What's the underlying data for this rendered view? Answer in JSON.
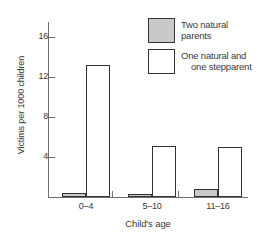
{
  "chart_data": {
    "type": "bar",
    "title": "",
    "xlabel": "Child's age",
    "ylabel": "Victims per 1000 children",
    "categories": [
      "0–4",
      "5–10",
      "11–16"
    ],
    "series": [
      {
        "name": "Two natural parents",
        "values": [
          0.4,
          0.3,
          0.8
        ],
        "color": "#c9c9c9"
      },
      {
        "name": "One natural and one stepparent",
        "values": [
          13.2,
          5.1,
          5.0
        ],
        "color": "#ffffff"
      }
    ],
    "ylim": [
      0,
      17.5
    ],
    "yticks": [
      4,
      8,
      12,
      16
    ],
    "ytick_labels": [
      "4",
      "8",
      "12",
      "16"
    ],
    "grid": false,
    "legend_position": "top-right"
  },
  "legend": {
    "items": [
      {
        "line1": "Two natural",
        "line2": "parents"
      },
      {
        "line1": "One natural and",
        "line2": "one stepparent"
      }
    ]
  },
  "axes": {
    "y_title": "Victims per 1000 children",
    "x_title": "Child's age",
    "y_labels": {
      "t0": "16",
      "t1": "12",
      "t2": "8",
      "t3": "4"
    },
    "x_labels": {
      "c0": "0–4",
      "c1": "5–10",
      "c2": "11–16"
    }
  }
}
